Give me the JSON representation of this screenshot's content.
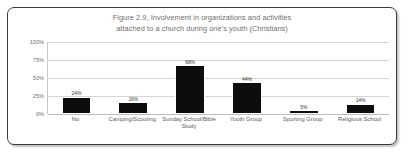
{
  "figure": {
    "title_line1": "Figure 2.9, Involvement in organizations and activities",
    "title_line2": "attached to a church during one's youth (Christians)",
    "title": "Figure 2.9, Involvement in organizations and activities\nattached to a church during one's youth (Christians)",
    "frame_color": "#3a3a3a",
    "background": "#ffffff"
  },
  "chart_data": {
    "type": "bar",
    "title": "Figure 2.9, Involvement in organizations and activities attached to a church during one's youth (Christians)",
    "categories": [
      "No",
      "Camping/Scouting",
      "Sunday School/Bible Study",
      "Youth Group",
      "Sporting Group",
      "Religious School"
    ],
    "values": [
      24,
      16,
      68,
      44,
      5,
      14
    ],
    "data_labels": [
      "24%",
      "16%",
      "68%",
      "44%",
      "5%",
      "14%"
    ],
    "xlabel": "",
    "ylabel": "",
    "ylim": [
      0,
      100
    ],
    "yticks": [
      0,
      25,
      50,
      75,
      100
    ],
    "ytick_labels": [
      "0%",
      "25%",
      "50%",
      "75%",
      "100%"
    ],
    "grid": true,
    "legend": false,
    "bar_color": "#0d0d0d",
    "gridline_color": "#d5d5d5"
  }
}
